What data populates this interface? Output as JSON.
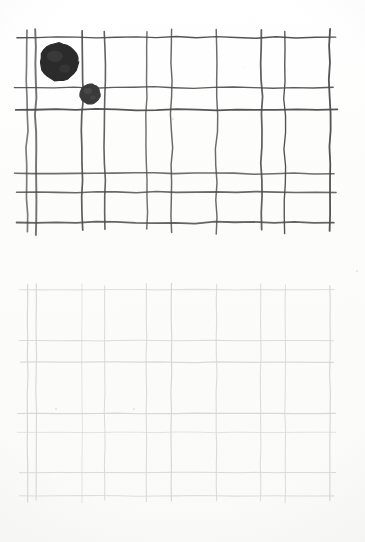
{
  "document": {
    "title": "Hand-drawn grid worksheet scan",
    "background_color": "#fdfdfd",
    "width": 365,
    "height": 542
  },
  "panels": [
    {
      "name": "top-grid",
      "description": "Hand-drawn dark pencil grid with two filled circular markers",
      "ink_color": "#4a4a4c",
      "stroke_width": 1.6,
      "bounds": {
        "x": 17,
        "y": 30,
        "width": 315,
        "height": 192
      },
      "columns": 9,
      "rows": 5,
      "vertical_line_x": [
        27,
        36,
        82,
        105,
        147,
        171,
        216,
        261,
        285,
        330
      ],
      "horizontal_line_y": [
        38,
        88,
        110,
        173,
        192,
        222
      ],
      "markers": [
        {
          "name": "large-stone",
          "shape": "circle",
          "color": "#2b2b2b",
          "cx": 59,
          "cy": 62,
          "r": 19,
          "cell_column": 1,
          "cell_row": 1,
          "size_label": "large"
        },
        {
          "name": "small-stone",
          "shape": "circle",
          "color": "#3a3a3a",
          "cx": 90,
          "cy": 94,
          "r": 10,
          "cell_column": 2,
          "cell_row": 2,
          "size_label": "small"
        }
      ]
    },
    {
      "name": "bottom-grid",
      "description": "Faint light-gray copy of the same grid, empty, no markers",
      "ink_color": "#d6d6da",
      "stroke_width": 1.0,
      "bounds": {
        "x": 17,
        "y": 24,
        "width": 315,
        "height": 212
      },
      "columns": 9,
      "rows": 6,
      "vertical_line_x": [
        27,
        36,
        82,
        105,
        147,
        171,
        216,
        261,
        285,
        330
      ],
      "horizontal_line_y": [
        24,
        74,
        96,
        147,
        167,
        207,
        230
      ],
      "markers": []
    }
  ],
  "palette": {
    "paper": "#fdfdfd",
    "dark_ink": "#4a4a4c",
    "faint_ink": "#d6d6da",
    "stone_fill": "#2b2b2b"
  }
}
